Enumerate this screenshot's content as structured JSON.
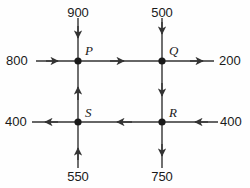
{
  "diagram": {
    "type": "network-flow-diagram",
    "background_color": "#fefefe",
    "line_color": "#333333",
    "text_color": "#1a1a1a",
    "nodes": [
      {
        "id": "P",
        "label": "P",
        "x": 78,
        "y": 61
      },
      {
        "id": "Q",
        "label": "Q",
        "x": 162,
        "y": 61
      },
      {
        "id": "S",
        "label": "S",
        "x": 78,
        "y": 122
      },
      {
        "id": "R",
        "label": "R",
        "x": 162,
        "y": 122
      }
    ],
    "external_flows": [
      {
        "id": "in-top-p",
        "value": "900",
        "node": "P",
        "side": "top",
        "direction": "into-node"
      },
      {
        "id": "in-top-q",
        "value": "500",
        "node": "Q",
        "side": "top",
        "direction": "into-node"
      },
      {
        "id": "in-left-p",
        "value": "800",
        "node": "P",
        "side": "left",
        "direction": "into-node"
      },
      {
        "id": "out-right-q",
        "value": "200",
        "node": "Q",
        "side": "right",
        "direction": "out-of-node"
      },
      {
        "id": "out-left-s",
        "value": "400",
        "node": "S",
        "side": "left",
        "direction": "out-of-node"
      },
      {
        "id": "in-right-r",
        "value": "400",
        "node": "R",
        "side": "right",
        "direction": "into-node"
      },
      {
        "id": "in-bottom-s",
        "value": "550",
        "node": "S",
        "side": "bottom",
        "direction": "into-node"
      },
      {
        "id": "out-bottom-r",
        "value": "750",
        "node": "R",
        "side": "bottom",
        "direction": "out-of-node"
      }
    ],
    "internal_edges": [
      {
        "id": "edge-p-q",
        "from": "P",
        "to": "Q",
        "orientation": "horizontal",
        "arrow": "right"
      },
      {
        "id": "edge-r-s",
        "from": "R",
        "to": "S",
        "orientation": "horizontal",
        "arrow": "left"
      },
      {
        "id": "edge-s-p",
        "from": "S",
        "to": "P",
        "orientation": "vertical",
        "arrow": "up"
      },
      {
        "id": "edge-q-r",
        "from": "Q",
        "to": "R",
        "orientation": "vertical",
        "arrow": "down"
      }
    ]
  },
  "labels": {
    "top_left_value": "900",
    "top_right_value": "500",
    "left_top_value": "800",
    "right_top_value": "200",
    "left_bottom_value": "400",
    "right_bottom_value": "400",
    "bottom_left_value": "550",
    "bottom_right_value": "750",
    "node_p": "P",
    "node_q": "Q",
    "node_s": "S",
    "node_r": "R"
  }
}
